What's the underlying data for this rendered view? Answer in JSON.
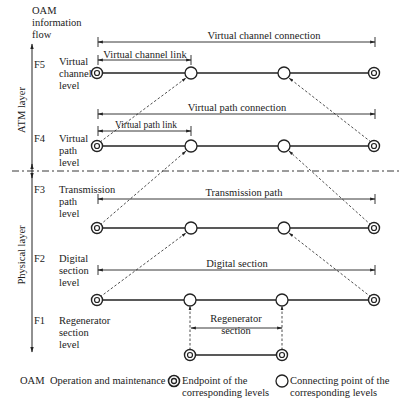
{
  "header": {
    "oam_flow_label": [
      "OAM",
      "information",
      "flow"
    ]
  },
  "layers": {
    "atm": "ATM layer",
    "physical": "Physical layer"
  },
  "levels": [
    {
      "code": "F5",
      "name": [
        "Virtual",
        "channel",
        "level"
      ]
    },
    {
      "code": "F4",
      "name": [
        "Virtual",
        "path",
        "level"
      ]
    },
    {
      "code": "F3",
      "name": [
        "Transmission",
        "path",
        "level"
      ]
    },
    {
      "code": "F2",
      "name": [
        "Digital",
        "section",
        "level"
      ]
    },
    {
      "code": "F1",
      "name": [
        "Regenerator",
        "section",
        "level"
      ]
    }
  ],
  "spans": {
    "vc_connection": "Virtual channel connection",
    "vc_link": "Virtual channel link",
    "vp_connection": "Virtual path connection",
    "vp_link": "Virtual path link",
    "transmission_path": "Transmission path",
    "digital_section": "Digital section",
    "regenerator_section": [
      "Regenerator",
      "section"
    ]
  },
  "legend": {
    "abbrev": "OAM",
    "abbrev_meaning": "Operation and maintenance",
    "endpoint": [
      "Endpoint of the",
      "corresponding levels"
    ],
    "connecting_point": [
      "Connecting point of the",
      "corresponding levels"
    ]
  },
  "colors": {
    "ink": "#222222",
    "background": "#ffffff"
  }
}
